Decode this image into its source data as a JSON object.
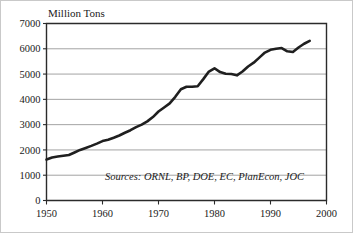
{
  "figure": {
    "background_color": "#ffffff",
    "border_color": "#c9c9c9"
  },
  "chart_data": {
    "type": "line",
    "title": "",
    "axis_title": "Million Tons",
    "xlabel": "",
    "ylabel": "Million Tons",
    "xlim": [
      1950,
      2000
    ],
    "ylim": [
      0,
      7000
    ],
    "grid": "horizontal",
    "legend_position": "none",
    "line_color": "#1f1f1f",
    "grid_color": "#8c8c8c",
    "xticks": [
      1950,
      1960,
      1970,
      1980,
      1990,
      2000
    ],
    "xtick_labels": [
      "1950",
      "1960",
      "1970",
      "1980",
      "1990",
      "2000"
    ],
    "yticks": [
      0,
      1000,
      2000,
      3000,
      4000,
      5000,
      6000,
      7000
    ],
    "ytick_labels": [
      "0",
      "1000",
      "2000",
      "3000",
      "4000",
      "5000",
      "6000",
      "7000"
    ],
    "annotations": [
      {
        "name": "sources-note",
        "text": "Sources: ORNL, BP, DOE, EC, PlanEcon, JOC",
        "x": 1996,
        "y": 800,
        "style": "italic"
      }
    ],
    "series": [
      {
        "name": "World Carbon Emissions",
        "x": [
          1950,
          1951,
          1952,
          1953,
          1954,
          1955,
          1956,
          1957,
          1958,
          1959,
          1960,
          1961,
          1962,
          1963,
          1964,
          1965,
          1966,
          1967,
          1968,
          1969,
          1970,
          1971,
          1972,
          1973,
          1974,
          1975,
          1976,
          1977,
          1978,
          1979,
          1980,
          1981,
          1982,
          1983,
          1984,
          1985,
          1986,
          1987,
          1988,
          1989,
          1990,
          1991,
          1992,
          1993,
          1994,
          1995,
          1996,
          1997
        ],
        "values": [
          1620,
          1700,
          1740,
          1770,
          1800,
          1900,
          2000,
          2080,
          2160,
          2250,
          2350,
          2400,
          2480,
          2570,
          2680,
          2780,
          2900,
          3000,
          3130,
          3300,
          3520,
          3680,
          3840,
          4100,
          4400,
          4500,
          4500,
          4520,
          4800,
          5100,
          5230,
          5080,
          5010,
          5000,
          4950,
          5100,
          5300,
          5450,
          5650,
          5850,
          5960,
          6000,
          6030,
          5900,
          5870,
          6050,
          6200,
          6310
        ]
      }
    ]
  }
}
